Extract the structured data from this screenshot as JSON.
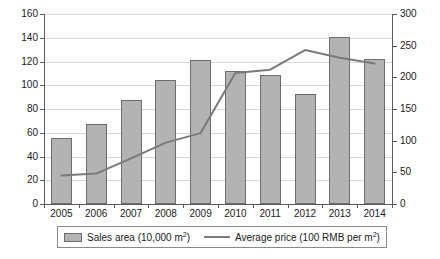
{
  "chart_data": {
    "type": "bar",
    "title": "",
    "subtitle": "",
    "xlabel": "",
    "ylabel": "",
    "grid": true,
    "legend_position": "bottom",
    "categories": [
      "2005",
      "2006",
      "2007",
      "2008",
      "2009",
      "2010",
      "2011",
      "2012",
      "2013",
      "2014"
    ],
    "axes": {
      "left": {
        "label": "Sales area (10,000 m2)",
        "min": 0,
        "max": 160,
        "step": 20,
        "ticks": [
          "0",
          "20",
          "40",
          "60",
          "80",
          "100",
          "120",
          "140",
          "160"
        ]
      },
      "right": {
        "label": "Average price (100 RMB per m2)",
        "min": 0,
        "max": 300,
        "step": 50,
        "ticks": [
          "0",
          "50",
          "100",
          "150",
          "200",
          "250",
          "300"
        ]
      }
    },
    "series": [
      {
        "name": "Sales area (10,000 m2)",
        "type": "bar",
        "axis": "left",
        "color": "#b3b3b3",
        "border_color": "#6e6e6e",
        "values": [
          56,
          67,
          88,
          104.5,
          121.5,
          112,
          109,
          93,
          140.5,
          122
        ]
      },
      {
        "name": "Average price (100 RMB per m2)",
        "type": "line",
        "axis": "right",
        "color": "#7a7a7a",
        "values": [
          45,
          48,
          72,
          97,
          112,
          207,
          212,
          243,
          231,
          222
        ]
      }
    ]
  },
  "legend": {
    "entries": [
      {
        "icon": "bar-swatch",
        "text_main": "Sales area (10,000 m",
        "sup": "2",
        "text_tail": ")"
      },
      {
        "icon": "line-swatch",
        "text_main": "Average price (100 RMB per m",
        "sup": "2",
        "text_tail": ")"
      }
    ]
  },
  "colors": {
    "bar_fill": "#b3b3b3",
    "bar_border": "#6e6e6e",
    "line": "#7a7a7a",
    "gridline": "#d9d9d9",
    "axis": "#5a5a5a",
    "text": "#1a1a1a",
    "background": "#ffffff"
  }
}
